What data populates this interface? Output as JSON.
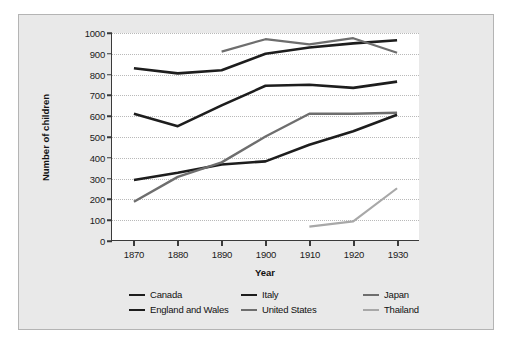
{
  "chart_data": {
    "type": "line",
    "title": "",
    "xlabel": "Year",
    "ylabel": "Number of children",
    "x": [
      1870,
      1880,
      1890,
      1900,
      1910,
      1920,
      1930
    ],
    "xlim": [
      1865,
      1935
    ],
    "ylim": [
      0,
      1000
    ],
    "yticks": [
      0,
      100,
      200,
      300,
      400,
      500,
      600,
      700,
      800,
      900,
      1000
    ],
    "xticks": [
      1870,
      1880,
      1890,
      1900,
      1910,
      1920,
      1930
    ],
    "grid": "horizontal-dotted",
    "legend_position": "bottom",
    "series": [
      {
        "name": "Canada",
        "color": "#1d1d1d",
        "width": 2.6,
        "x": [
          1870,
          1880,
          1890,
          1900,
          1910,
          1920,
          1930
        ],
        "values": [
          830,
          805,
          820,
          900,
          930,
          950,
          965
        ]
      },
      {
        "name": "England and Wales",
        "color": "#1d1d1d",
        "width": 2.6,
        "x": [
          1870,
          1880,
          1890,
          1900,
          1910,
          1920,
          1930
        ],
        "values": [
          610,
          550,
          650,
          745,
          750,
          735,
          765
        ]
      },
      {
        "name": "Italy",
        "color": "#1d1d1d",
        "width": 2.6,
        "x": [
          1870,
          1880,
          1890,
          1900,
          1910,
          1920,
          1930
        ],
        "values": [
          290,
          325,
          365,
          380,
          460,
          525,
          605
        ]
      },
      {
        "name": "United States",
        "color": "#6e6e6e",
        "width": 2.4,
        "x": [
          1870,
          1880,
          1890,
          1900,
          1910,
          1920,
          1930
        ],
        "values": [
          185,
          305,
          375,
          500,
          610,
          610,
          615
        ]
      },
      {
        "name": "Japan",
        "color": "#6e6e6e",
        "width": 2.2,
        "x": [
          1890,
          1900,
          1910,
          1920,
          1930
        ],
        "values": [
          910,
          970,
          945,
          975,
          905
        ]
      },
      {
        "name": "Thailand",
        "color": "#a8a8a8",
        "width": 2.2,
        "x": [
          1910,
          1920,
          1930
        ],
        "values": [
          65,
          90,
          250
        ]
      }
    ]
  },
  "legend": {
    "items": [
      {
        "label": "Canada"
      },
      {
        "label": "England and Wales"
      },
      {
        "label": "Italy"
      },
      {
        "label": "United States"
      },
      {
        "label": "Japan"
      },
      {
        "label": "Thailand"
      }
    ]
  },
  "colors": {
    "figure_background": "#e9e9e9",
    "plot_background": "#ffffff",
    "axis": "#3a3a3a",
    "gridline": "#b9b9b9",
    "border": "#b4b4b4"
  }
}
